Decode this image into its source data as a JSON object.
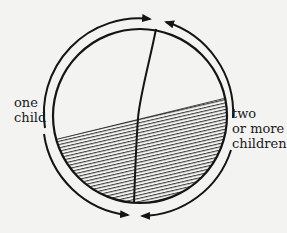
{
  "diagram": {
    "type": "circle-partition",
    "labels": {
      "left": [
        "one",
        "child"
      ],
      "right": [
        "two",
        "or more",
        "children"
      ]
    },
    "regions": [
      {
        "name": "one-child-unhatched",
        "side": "left",
        "pattern": "plain"
      },
      {
        "name": "two-or-more-unhatched",
        "side": "right",
        "pattern": "plain"
      },
      {
        "name": "hatched-lower",
        "pattern": "horizontal-hatch"
      }
    ],
    "arrows": [
      {
        "name": "left-upper-arrow",
        "direction": "clockwise-to-top"
      },
      {
        "name": "right-upper-arrow",
        "direction": "counterclockwise-to-top"
      },
      {
        "name": "left-lower-arrow",
        "direction": "counterclockwise-to-bottom"
      },
      {
        "name": "right-lower-arrow",
        "direction": "clockwise-to-bottom"
      }
    ],
    "colors": {
      "ink": "#151515",
      "paper": "#f3f3f1"
    }
  }
}
